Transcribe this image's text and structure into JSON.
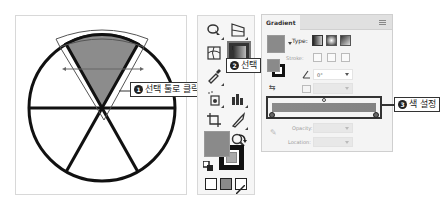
{
  "artboard": {
    "shape": "pie-circle-6-slices",
    "selected_slice_fill": "#8c8c8c",
    "stroke_color": "#111111"
  },
  "callouts": [
    {
      "number": "1",
      "text": "선택 툴로 클릭"
    },
    {
      "number": "2",
      "text": "선택"
    },
    {
      "number": "3",
      "text": "색 설정"
    }
  ],
  "toolbar": {
    "tools": [
      {
        "name": "shape-builder-tool"
      },
      {
        "name": "perspective-grid-tool"
      },
      {
        "name": "mesh-tool"
      },
      {
        "name": "gradient-tool",
        "active": true
      },
      {
        "name": "eyedropper-tool"
      },
      {
        "name": "blend-tool"
      },
      {
        "name": "symbol-sprayer-tool"
      },
      {
        "name": "column-graph-tool"
      },
      {
        "name": "artboard-tool"
      },
      {
        "name": "slice-tool"
      },
      {
        "name": "hand-tool"
      },
      {
        "name": "zoom-tool"
      }
    ],
    "fill_color": "#8a8a8a",
    "stroke_color": "#111111",
    "modes": [
      "color",
      "gradient",
      "none"
    ]
  },
  "gradient_panel": {
    "title": "Gradient",
    "type_label": "Type:",
    "stroke_label": "Stroke:",
    "angle_value": "0°",
    "opacity_label": "Opacity:",
    "location_label": "Location:",
    "gradient_start": "#8a8a8a",
    "gradient_end": "#838383"
  }
}
